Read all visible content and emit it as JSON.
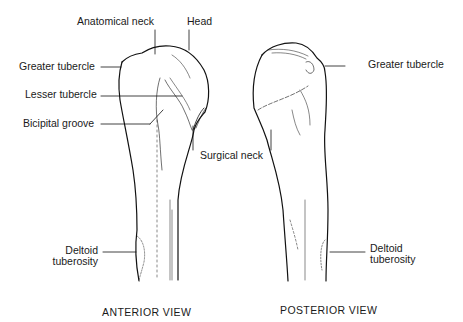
{
  "diagram": {
    "views": [
      {
        "caption": "ANTERIOR VIEW",
        "labels": {
          "anatomical_neck": "Anatomical neck",
          "head": "Head",
          "greater_tubercle": "Greater tubercle",
          "lesser_tubercle": "Lesser tubercle",
          "bicipital_groove": "Bicipital groove",
          "surgical_neck": "Surgical neck",
          "deltoid_tuberosity_1": "Deltoid",
          "deltoid_tuberosity_2": "tuberosity"
        }
      },
      {
        "caption": "POSTERIOR VIEW",
        "labels": {
          "greater_tubercle": "Greater tubercle",
          "deltoid_tuberosity_1": "Deltoid",
          "deltoid_tuberosity_2": "tuberosity"
        }
      }
    ]
  }
}
